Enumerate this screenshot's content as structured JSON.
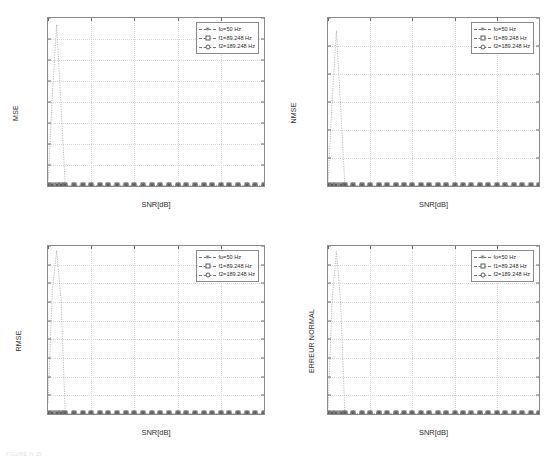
{
  "figure": {
    "caption": "FIGURE IV.25",
    "panel_count": 4
  },
  "legend_common": {
    "entries": [
      {
        "label": "fo=50 Hz",
        "marker": "star"
      },
      {
        "label": "f1=89.248 Hz",
        "marker": "square"
      },
      {
        "label": "f2=189.248 Hz",
        "marker": "circle"
      }
    ]
  },
  "chart_data": [
    {
      "id": "mse",
      "type": "line",
      "title": "",
      "xlabel": "SNR[dB]",
      "ylabel": "MSE",
      "xlim": [
        0,
        50
      ],
      "ylim": [
        0,
        8000
      ],
      "xticks": [
        0,
        10,
        20,
        30,
        40,
        50
      ],
      "yticks": [
        0,
        1000,
        2000,
        3000,
        4000,
        5000,
        6000,
        7000,
        8000
      ],
      "ytick_labels": [
        "0",
        "1000",
        "2000",
        "3000",
        "4000",
        "5000",
        "6000",
        "7000",
        "8000"
      ],
      "xtick_labels": [
        "0",
        "10",
        "20",
        "30",
        "40",
        "50"
      ],
      "grid": true,
      "legend_position": "top-right",
      "x": [
        0,
        1,
        2,
        3,
        4,
        6,
        8,
        10,
        12,
        14,
        16,
        18,
        20,
        22,
        24,
        26,
        28,
        30,
        32,
        34,
        36,
        38,
        40,
        42,
        44,
        46,
        48,
        50
      ],
      "series": [
        {
          "name": "fo=50 Hz",
          "marker": "star",
          "values": [
            0,
            0,
            0,
            0,
            0,
            0,
            0,
            0,
            0,
            0,
            0,
            0,
            0,
            0,
            0,
            0,
            0,
            0,
            0,
            0,
            0,
            0,
            0,
            0,
            0,
            0,
            0,
            0
          ]
        },
        {
          "name": "f1=89.248 Hz",
          "marker": "square",
          "values": [
            0,
            0,
            0,
            0,
            0,
            0,
            0,
            0,
            0,
            0,
            0,
            0,
            0,
            0,
            0,
            0,
            0,
            0,
            0,
            0,
            0,
            0,
            0,
            0,
            0,
            0,
            0,
            0
          ]
        },
        {
          "name": "f2=189.248 Hz",
          "marker": "circle",
          "values": [
            40,
            4300,
            7680,
            3900,
            0,
            0,
            0,
            0,
            0,
            0,
            0,
            0,
            0,
            0,
            0,
            0,
            0,
            0,
            0,
            0,
            0,
            0,
            0,
            0,
            0,
            0,
            0,
            0
          ]
        }
      ]
    },
    {
      "id": "nmse",
      "type": "line",
      "title": "",
      "xlabel": "SNR[dB]",
      "ylabel": "NMSE",
      "xlim": [
        0,
        50
      ],
      "ylim": [
        0,
        0.012
      ],
      "xticks": [
        0,
        10,
        20,
        30,
        40,
        50
      ],
      "yticks": [
        0,
        0.002,
        0.004,
        0.006,
        0.008,
        0.01,
        0.012
      ],
      "ytick_labels": [
        "0",
        "0.002",
        "0.004",
        "0.006",
        "0.008",
        "0.01",
        "0.012"
      ],
      "xtick_labels": [
        "0",
        "10",
        "20",
        "30",
        "40",
        "50"
      ],
      "grid": true,
      "legend_position": "top-right",
      "x": [
        0,
        1,
        2,
        3,
        4,
        6,
        8,
        10,
        12,
        14,
        16,
        18,
        20,
        22,
        24,
        26,
        28,
        30,
        32,
        34,
        36,
        38,
        40,
        42,
        44,
        46,
        48,
        50
      ],
      "series": [
        {
          "name": "fo=50 Hz",
          "marker": "star",
          "values": [
            0,
            0,
            0,
            0,
            0,
            0,
            0,
            0,
            0,
            0,
            0,
            0,
            0,
            0,
            0,
            0,
            0,
            0,
            0,
            0,
            0,
            0,
            0,
            0,
            0,
            0,
            0,
            0
          ]
        },
        {
          "name": "f1=89.248 Hz",
          "marker": "square",
          "values": [
            0,
            0,
            0,
            0,
            0,
            0,
            0,
            0,
            0,
            0,
            0,
            0,
            0,
            0,
            0,
            0,
            0,
            0,
            0,
            0,
            0,
            0,
            0,
            0,
            0,
            0,
            0,
            0
          ]
        },
        {
          "name": "f2=189.248 Hz",
          "marker": "circle",
          "values": [
            6e-05,
            0.0062,
            0.0111,
            0.0056,
            0,
            0,
            0,
            0,
            0,
            0,
            0,
            0,
            0,
            0,
            0,
            0,
            0,
            0,
            0,
            0,
            0,
            0,
            0,
            0,
            0,
            0,
            0,
            0
          ]
        }
      ]
    },
    {
      "id": "rmse",
      "type": "line",
      "title": "",
      "xlabel": "SNR[dB]",
      "ylabel": "RMSE",
      "xlim": [
        0,
        50
      ],
      "ylim": [
        0,
        90
      ],
      "xticks": [
        0,
        10,
        20,
        30,
        40,
        50
      ],
      "yticks": [
        0,
        10,
        20,
        30,
        40,
        50,
        60,
        70,
        80,
        90
      ],
      "ytick_labels": [
        "0",
        "10",
        "20",
        "30",
        "40",
        "50",
        "60",
        "70",
        "80",
        "90"
      ],
      "xtick_labels": [
        "0",
        "10",
        "20",
        "30",
        "40",
        "50"
      ],
      "grid": true,
      "legend_position": "top-right",
      "x": [
        0,
        1,
        2,
        3,
        4,
        6,
        8,
        10,
        12,
        14,
        16,
        18,
        20,
        22,
        24,
        26,
        28,
        30,
        32,
        34,
        36,
        38,
        40,
        42,
        44,
        46,
        48,
        50
      ],
      "series": [
        {
          "name": "fo=50 Hz",
          "marker": "star",
          "values": [
            0,
            0,
            0,
            0,
            0,
            0,
            0,
            0,
            0,
            0,
            0,
            0,
            0,
            0,
            0,
            0,
            0,
            0,
            0,
            0,
            0,
            0,
            0,
            0,
            0,
            0,
            0,
            0
          ]
        },
        {
          "name": "f1=89.248 Hz",
          "marker": "square",
          "values": [
            0,
            0,
            0,
            0,
            0,
            0,
            0,
            0,
            0,
            0,
            0,
            0,
            0,
            0,
            0,
            0,
            0,
            0,
            0,
            0,
            0,
            0,
            0,
            0,
            0,
            0,
            0,
            0
          ]
        },
        {
          "name": "f2=189.248 Hz",
          "marker": "circle",
          "values": [
            6,
            66,
            87.5,
            62,
            0,
            0,
            0,
            0,
            0,
            0,
            0,
            0,
            0,
            0,
            0,
            0,
            0,
            0,
            0,
            0,
            0,
            0,
            0,
            0,
            0,
            0,
            0,
            0
          ]
        }
      ]
    },
    {
      "id": "erreur-normal",
      "type": "line",
      "title": "",
      "xlabel": "SNR[dB]",
      "ylabel": "ERREUR NORMAL",
      "xlim": [
        0,
        50
      ],
      "ylim": [
        0,
        90
      ],
      "xticks": [
        0,
        10,
        20,
        30,
        40,
        50
      ],
      "yticks": [
        0,
        10,
        20,
        30,
        40,
        50,
        60,
        70,
        80,
        90
      ],
      "ytick_labels": [
        "0",
        "10",
        "20",
        "30",
        "40",
        "50",
        "60",
        "70",
        "80",
        "90"
      ],
      "xtick_labels": [
        "0",
        "10",
        "20",
        "30",
        "40",
        "50"
      ],
      "grid": true,
      "legend_position": "top-right",
      "x": [
        0,
        1,
        2,
        3,
        4,
        6,
        8,
        10,
        12,
        14,
        16,
        18,
        20,
        22,
        24,
        26,
        28,
        30,
        32,
        34,
        36,
        38,
        40,
        42,
        44,
        46,
        48,
        50
      ],
      "series": [
        {
          "name": "fo=50 Hz",
          "marker": "star",
          "values": [
            0,
            0,
            0,
            0,
            0,
            0,
            0,
            0,
            0,
            0,
            0,
            0,
            0,
            0,
            0,
            0,
            0,
            0,
            0,
            0,
            0,
            0,
            0,
            0,
            0,
            0,
            0,
            0
          ]
        },
        {
          "name": "f1=89.248 Hz",
          "marker": "square",
          "values": [
            0,
            0,
            0,
            0,
            0,
            0,
            0,
            0,
            0,
            0,
            0,
            0,
            0,
            0,
            0,
            0,
            0,
            0,
            0,
            0,
            0,
            0,
            0,
            0,
            0,
            0,
            0,
            0
          ]
        },
        {
          "name": "f2=189.248 Hz",
          "marker": "circle",
          "values": [
            2,
            62,
            87,
            60,
            0,
            0,
            0,
            0,
            0,
            0,
            0,
            0,
            0,
            0,
            0,
            0,
            0,
            0,
            0,
            0,
            0,
            0,
            0,
            0,
            0,
            0,
            0,
            0
          ]
        }
      ]
    }
  ],
  "colors": {
    "axis": "#8a8a8a",
    "grid": "#d9d9d9",
    "series": "#777777",
    "text": "#303030",
    "background": "#ffffff"
  }
}
